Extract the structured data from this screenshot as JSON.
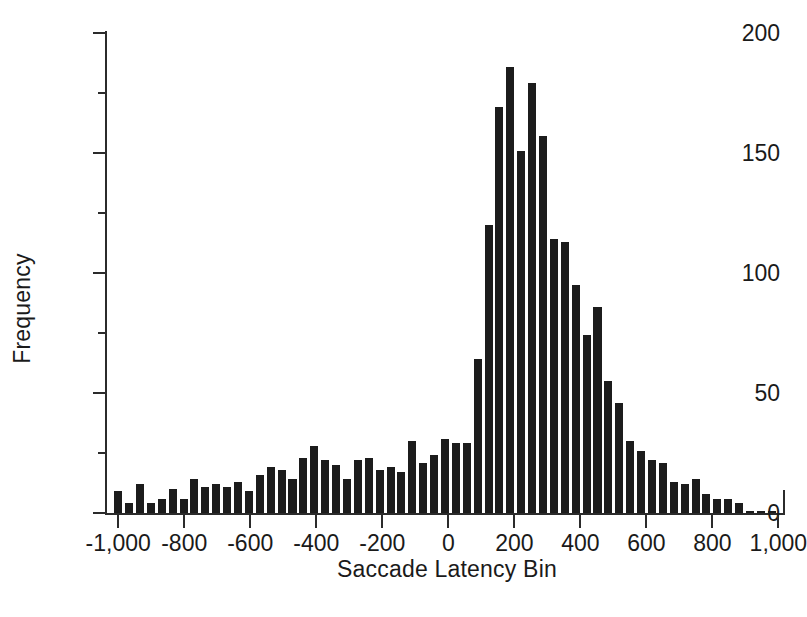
{
  "chart_data": {
    "type": "bar",
    "title": "",
    "subtitle": "",
    "xlabel": "Saccade Latency Bin",
    "ylabel": "Frequency",
    "xlim": [
      -1040,
      1020
    ],
    "ylim": [
      0,
      200
    ],
    "xticks": [
      -1000,
      -800,
      -600,
      -400,
      -200,
      0,
      200,
      400,
      600,
      800,
      1000
    ],
    "xticklabels": [
      "-1,000",
      "-800",
      "-600",
      "-400",
      "-200",
      "0",
      "200",
      "400",
      "600",
      "800",
      "1,000"
    ],
    "yticks": [
      0,
      50,
      100,
      150,
      200
    ],
    "yticklabels": [
      "0",
      "50",
      "100",
      "150",
      "200"
    ],
    "yticks_minor": [
      25,
      75,
      125,
      175
    ],
    "grid": false,
    "legend": null,
    "bar_color": "#1c1c1c",
    "bin_width": 33,
    "categories": [
      -1000,
      -967,
      -934,
      -901,
      -868,
      -835,
      -802,
      -769,
      -736,
      -703,
      -670,
      -637,
      -604,
      -571,
      -538,
      -505,
      -472,
      -439,
      -406,
      -373,
      -340,
      -307,
      -274,
      -241,
      -208,
      -175,
      -142,
      -109,
      -76,
      -43,
      -10,
      23,
      56,
      89,
      122,
      155,
      188,
      221,
      254,
      287,
      320,
      353,
      386,
      419,
      452,
      485,
      518,
      551,
      584,
      617,
      650,
      683,
      716,
      749,
      782,
      815,
      848,
      881,
      914,
      947,
      980
    ],
    "values": [
      9,
      4,
      12,
      4,
      6,
      10,
      6,
      14,
      11,
      12,
      11,
      13,
      9,
      16,
      19,
      18,
      14,
      23,
      28,
      22,
      20,
      14,
      22,
      23,
      18,
      19,
      17,
      30,
      21,
      24,
      31,
      29,
      29,
      64,
      120,
      169,
      186,
      151,
      179,
      157,
      114,
      113,
      95,
      74,
      86,
      55,
      46,
      30,
      26,
      22,
      21,
      13,
      12,
      14,
      8,
      6,
      6,
      4,
      1,
      1,
      1
    ]
  }
}
